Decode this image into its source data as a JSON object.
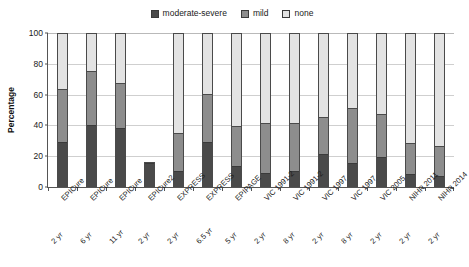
{
  "chart_data": {
    "type": "bar",
    "subtype": "stacked-bar-100",
    "title": "",
    "xlabel": "",
    "ylabel": "Percentage",
    "ylim": [
      0,
      100
    ],
    "yticks": [
      0,
      20,
      40,
      60,
      80,
      100
    ],
    "grid": true,
    "legend_position": "top-center",
    "legend": [
      "moderate-severe",
      "mild",
      "none"
    ],
    "colors": {
      "moderate-severe": "#4a4a4a",
      "mild": "#8d8d8d",
      "none": "#e3e3e3"
    },
    "categories": [
      "EPICure",
      "EPICure",
      "EPICure",
      "EPICure2",
      "EXPRESS",
      "EXPRESS",
      "EPIPAGE",
      "VIC 1991-2",
      "VIC 1991-2",
      "VIC 1997",
      "VIC 1997",
      "VIC 2005",
      "NIHR 2011",
      "NIHR 2014"
    ],
    "ages": [
      "2 yr",
      "6 yr",
      "11 yr",
      "2 yr",
      "2 yr",
      "6.5 yr",
      "5 yr",
      "2 yr",
      "8 yr",
      "2 yr",
      "8 yr",
      "2 yr",
      "2 yr",
      "2 yr"
    ],
    "series": [
      {
        "name": "moderate-severe",
        "values": [
          30,
          41,
          39,
          16,
          11,
          30,
          14,
          10,
          11,
          22,
          16,
          20,
          9,
          8
        ]
      },
      {
        "name": "mild",
        "values": [
          34,
          35,
          29,
          0,
          25,
          31,
          26,
          32,
          31,
          24,
          36,
          28,
          20,
          19
        ]
      },
      {
        "name": "none",
        "values": [
          36,
          24,
          32,
          0,
          64,
          39,
          60,
          58,
          58,
          54,
          48,
          52,
          71,
          73
        ]
      }
    ],
    "cumulative_tops": {
      "moderate-severe": [
        30,
        41,
        39,
        16,
        11,
        30,
        14,
        10,
        11,
        22,
        16,
        20,
        9,
        8
      ],
      "mild": [
        64,
        76,
        68,
        16,
        36,
        61,
        40,
        42,
        42,
        46,
        52,
        48,
        29,
        27
      ],
      "none": [
        100,
        100,
        100,
        16,
        100,
        100,
        100,
        100,
        100,
        100,
        100,
        100,
        100,
        100
      ]
    }
  }
}
